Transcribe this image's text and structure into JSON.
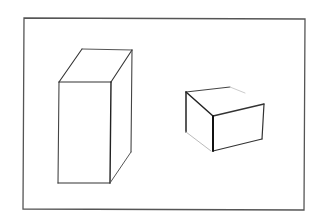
{
  "canvas": {
    "width": 318,
    "height": 217,
    "background": "#ffffff"
  },
  "frame": {
    "points": [
      [
        24,
        18
      ],
      [
        305,
        19
      ],
      [
        304,
        210
      ],
      [
        23,
        209
      ]
    ],
    "stroke": "#555555",
    "width": 1.3
  },
  "shapes": [
    {
      "name": "tall-box",
      "edges": [
        {
          "from": [
            59,
            82
          ],
          "to": [
            111,
            82
          ],
          "stroke": "#333333",
          "width": 1.1
        },
        {
          "from": [
            59,
            82
          ],
          "to": [
            58,
            183
          ],
          "stroke": "#444444",
          "width": 1.1
        },
        {
          "from": [
            58,
            183
          ],
          "to": [
            110,
            183
          ],
          "stroke": "#333333",
          "width": 1.1
        },
        {
          "from": [
            111,
            82
          ],
          "to": [
            110,
            183
          ],
          "stroke": "#222222",
          "width": 1.4
        },
        {
          "from": [
            59,
            82
          ],
          "to": [
            82,
            49
          ],
          "stroke": "#333333",
          "width": 1.1
        },
        {
          "from": [
            82,
            49
          ],
          "to": [
            132,
            50
          ],
          "stroke": "#555555",
          "width": 1.0
        },
        {
          "from": [
            132,
            50
          ],
          "to": [
            111,
            82
          ],
          "stroke": "#333333",
          "width": 1.1
        },
        {
          "from": [
            132,
            50
          ],
          "to": [
            131,
            152
          ],
          "stroke": "#444444",
          "width": 1.1
        },
        {
          "from": [
            131,
            152
          ],
          "to": [
            110,
            183
          ],
          "stroke": "#555555",
          "width": 1.0
        }
      ]
    },
    {
      "name": "small-box",
      "edges": [
        {
          "from": [
            186,
            92
          ],
          "to": [
            230,
            87
          ],
          "stroke": "#444444",
          "width": 1.1
        },
        {
          "from": [
            230,
            87
          ],
          "to": [
            245,
            93
          ],
          "stroke": "#cccccc",
          "width": 1.0
        },
        {
          "from": [
            186,
            92
          ],
          "to": [
            213,
            116
          ],
          "stroke": "#222222",
          "width": 1.5
        },
        {
          "from": [
            213,
            116
          ],
          "to": [
            264,
            104
          ],
          "stroke": "#333333",
          "width": 1.3
        },
        {
          "from": [
            264,
            104
          ],
          "to": [
            262,
            139
          ],
          "stroke": "#333333",
          "width": 1.2
        },
        {
          "from": [
            262,
            139
          ],
          "to": [
            213,
            151
          ],
          "stroke": "#333333",
          "width": 1.2
        },
        {
          "from": [
            213,
            116
          ],
          "to": [
            213,
            151
          ],
          "stroke": "#111111",
          "width": 2.0
        },
        {
          "from": [
            186,
            92
          ],
          "to": [
            186,
            132
          ],
          "stroke": "#222222",
          "width": 1.5
        },
        {
          "from": [
            186,
            132
          ],
          "to": [
            211,
            151
          ],
          "stroke": "#bbbbbb",
          "width": 1.0
        }
      ]
    }
  ]
}
